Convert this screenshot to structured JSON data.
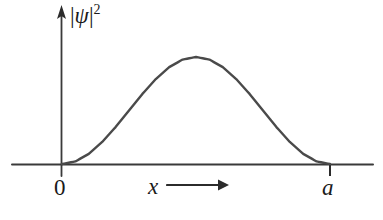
{
  "figure": {
    "kind": "probability-density-plot",
    "background_color": "#ffffff",
    "ink_color": "#3a3a3a",
    "text_color": "#1a1a1a"
  },
  "labels": {
    "y_axis": {
      "full": "|ψ|²",
      "open_bar": "|",
      "symbol": "ψ",
      "close_bar": "|",
      "exponent": "2"
    },
    "origin": "0",
    "x_axis": "x",
    "x_axis_arrow": "right-arrow",
    "right_tick": "a"
  },
  "chart_data": {
    "type": "line",
    "title": "",
    "subtitle": "",
    "xlabel": "x",
    "ylabel": "|ψ|²",
    "grid": false,
    "legend": null,
    "xlim": [
      0,
      1
    ],
    "ylim": [
      0,
      1
    ],
    "x_tick_labels": [
      "0",
      "a"
    ],
    "x_tick_values": [
      0,
      1
    ],
    "y_tick_labels": [],
    "annotations": [
      {
        "text": "x",
        "role": "axis-name-with-arrow",
        "x": 0.33,
        "y": -0.12
      },
      {
        "text": "|ψ|²",
        "role": "axis-name",
        "x": 0.04,
        "y": 1.0
      }
    ],
    "series": [
      {
        "name": "|ψ|² ground state, infinite square well",
        "function": "sin^2(pi*x/a)",
        "x": [
          0.0,
          0.05,
          0.1,
          0.15,
          0.2,
          0.25,
          0.3,
          0.35,
          0.4,
          0.45,
          0.5,
          0.55,
          0.6,
          0.65,
          0.7,
          0.75,
          0.8,
          0.85,
          0.9,
          0.95,
          1.0
        ],
        "values": [
          0.0,
          0.024,
          0.095,
          0.206,
          0.345,
          0.5,
          0.655,
          0.794,
          0.905,
          0.976,
          1.0,
          0.976,
          0.905,
          0.794,
          0.655,
          0.5,
          0.345,
          0.206,
          0.095,
          0.024,
          0.0
        ],
        "peak": {
          "x": 0.5,
          "y": 1.0
        }
      }
    ]
  }
}
